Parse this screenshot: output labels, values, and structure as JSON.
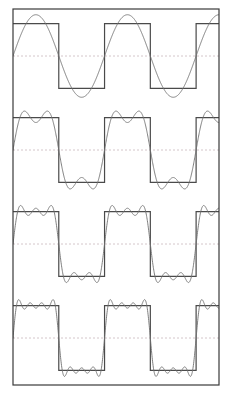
{
  "figure": {
    "background_color": "#ffffff",
    "frame_color": "#3a3a3a",
    "frame_width_px": 1.2,
    "frame": {
      "x": 13,
      "y": 9,
      "width": 206,
      "height": 376
    },
    "panel_count": 4,
    "panel_height_px": 94,
    "zero_line": {
      "style": "dashed",
      "color": "#c9b8bd",
      "dash_pattern": "2 2",
      "width_px": 0.8,
      "label": "zero-axis"
    }
  },
  "chart_data": {
    "type": "line",
    "subtitle": "Partial sums with 1, 2, 3 and 4 non-zero harmonics",
    "xlabel": "",
    "ylabel": "",
    "grid": false,
    "legend": "none",
    "xlim": [
      0,
      2.25
    ],
    "ylim": [
      -1.45,
      1.45
    ],
    "x_unit": "periods",
    "square_wave": {
      "name": "Ideal square wave",
      "color": "#4a4a4a",
      "width_px": 1.2,
      "amplitude": 1.0,
      "period": 1.0,
      "phase_offset": 0.0,
      "duty_cycle": 0.5,
      "cycles_shown": 2.25,
      "high_level": 1.0,
      "low_level": -1.0,
      "transitions_x": [
        0.5,
        1.0,
        1.5,
        2.0
      ]
    },
    "panels": [
      {
        "index": 1,
        "name": "panel-1-harmonic",
        "label": "n = 1",
        "terms": 1,
        "harmonics": [
          1
        ],
        "coefficients": [
          1.2732
        ],
        "series_name": "1-term partial sum",
        "series_color": "#6f6f6f",
        "series_width_px": 0.9,
        "peak_overshoot": 1.2732,
        "ripple_bumps_per_half_cycle": 1,
        "formula": "(4/pi) sin(2 pi x)"
      },
      {
        "index": 2,
        "name": "panel-2-harmonics",
        "label": "n = 3",
        "terms": 2,
        "harmonics": [
          1,
          3
        ],
        "coefficients": [
          1.2732,
          0.4244
        ],
        "series_name": "2-term partial sum",
        "series_color": "#6f6f6f",
        "series_width_px": 0.9,
        "peak_overshoot": 1.2001,
        "ripple_bumps_per_half_cycle": 2,
        "formula": "(4/pi)[ sin(2 pi x) + sin(6 pi x)/3 ]"
      },
      {
        "index": 3,
        "name": "panel-3-harmonics",
        "label": "n = 5",
        "terms": 3,
        "harmonics": [
          1,
          3,
          5
        ],
        "coefficients": [
          1.2732,
          0.4244,
          0.2546
        ],
        "series_name": "3-term partial sum",
        "series_color": "#6f6f6f",
        "series_width_px": 0.9,
        "peak_overshoot": 1.1938,
        "ripple_bumps_per_half_cycle": 3,
        "formula": "(4/pi)[ sin(2 pi x) + sin(6 pi x)/3 + sin(10 pi x)/5 ]"
      },
      {
        "index": 4,
        "name": "panel-4-harmonics",
        "label": "n = 7",
        "terms": 4,
        "harmonics": [
          1,
          3,
          5,
          7
        ],
        "coefficients": [
          1.2732,
          0.4244,
          0.2546,
          0.1819
        ],
        "series_name": "4-term partial sum",
        "series_color": "#6f6f6f",
        "series_width_px": 0.9,
        "peak_overshoot": 1.1844,
        "ripple_bumps_per_half_cycle": 4,
        "formula": "(4/pi)[ sin(2 pi x) + sin(6 pi x)/3 + sin(10 pi x)/5 + sin(14 pi x)/7 ]"
      }
    ]
  }
}
